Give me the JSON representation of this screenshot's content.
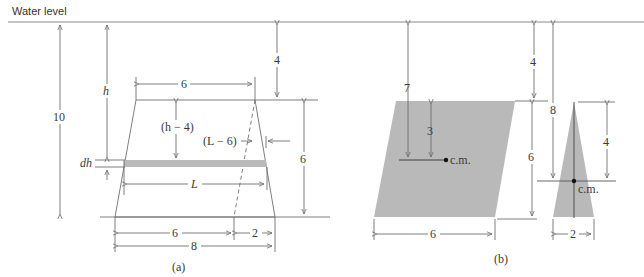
{
  "figure": {
    "water_level_label": "Water level",
    "colors": {
      "line": "#6f6f6f",
      "shade": "#b9b9b9",
      "text": "#3a3a3a",
      "point": "#111111"
    },
    "panel_a": {
      "caption": "(a)",
      "labels": {
        "depth_bottom": "10",
        "depth_strip": "h",
        "top_width": "6",
        "top_depth": "4",
        "strip_below_top": "(h − 4)",
        "strip_offset": "(L − 6)",
        "strip_thickness": "dh",
        "strip_length": "L",
        "height": "6",
        "bottom_left": "6",
        "bottom_right": "2",
        "bottom_total": "8"
      }
    },
    "panel_b": {
      "caption": "(b)",
      "labels": {
        "parallelogram_cm_depth": "7",
        "parallelogram_cm_from_top": "3",
        "parallelogram_cm": "c.m.",
        "top_depth": "4",
        "height": "6",
        "parallelogram_width": "6",
        "triangle_cm_depth": "8",
        "triangle_cm_from_top": "4",
        "triangle_cm": "c.m.",
        "triangle_base": "2"
      }
    }
  }
}
